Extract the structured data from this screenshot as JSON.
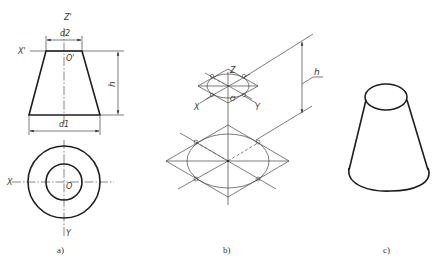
{
  "figure_a": {
    "caption": "a)",
    "labels": {
      "z_prime": "Z'",
      "x_prime": "X'",
      "o_prime": "O'",
      "d2": "d2",
      "d1": "d1",
      "h": "h",
      "x": "X",
      "o": "O",
      "y": "Y"
    },
    "front_view": {
      "top_half_width": 18,
      "bottom_half_width": 35.5,
      "height": 64
    },
    "top_view": {
      "outer_radius": 36,
      "inner_radius": 18
    }
  },
  "figure_b": {
    "caption": "b)",
    "labels": {
      "z": "Z",
      "x": "X",
      "y": "Y",
      "o": "O",
      "h": "h"
    }
  },
  "figure_c": {
    "caption": "c)",
    "description": "isometric truncated cone"
  },
  "colors": {
    "line": "#1e1e1e",
    "thin_line": "#444444",
    "background": "#ffffff"
  }
}
